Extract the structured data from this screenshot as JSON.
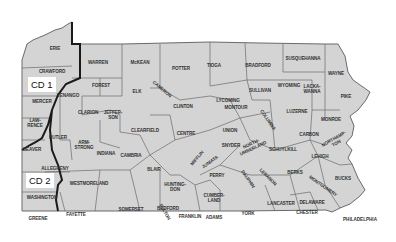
{
  "map": {
    "title": "Pennsylvania counties with congressional districts CD 1 and CD 2",
    "colors": {
      "land": "#d4d4d4",
      "county_border": "#6a6a6a",
      "district_line": "#1a1a1a",
      "background": "#ffffff",
      "label": "#333333"
    },
    "districts": [
      {
        "id": "cd1",
        "label": "CD 1"
      },
      {
        "id": "cd2",
        "label": "CD 2"
      }
    ],
    "cities": [
      {
        "id": "philadelphia",
        "label": "PHILADELPHIA"
      }
    ],
    "counties": [
      {
        "id": "erie",
        "label": "ERIE"
      },
      {
        "id": "crawford",
        "label": "CRAWFORD"
      },
      {
        "id": "mercer",
        "label": "MERCER"
      },
      {
        "id": "lawrence",
        "label": "LAW-\nRENCE"
      },
      {
        "id": "beaver",
        "label": "BEAVER"
      },
      {
        "id": "butler",
        "label": "BUTLER"
      },
      {
        "id": "allegheny",
        "label": "ALLEGHENY"
      },
      {
        "id": "washington",
        "label": "WASHINGTON"
      },
      {
        "id": "greene",
        "label": "GREENE"
      },
      {
        "id": "fayette",
        "label": "FAYETTE"
      },
      {
        "id": "westmoreland",
        "label": "WESTMORELAND"
      },
      {
        "id": "armstrong",
        "label": "ARM-\nSTRONG"
      },
      {
        "id": "indiana",
        "label": "INDIANA"
      },
      {
        "id": "venango",
        "label": "VENANGO"
      },
      {
        "id": "warren",
        "label": "WARREN"
      },
      {
        "id": "forest",
        "label": "FOREST"
      },
      {
        "id": "clarion",
        "label": "CLARION"
      },
      {
        "id": "jefferson",
        "label": "JEFFER-\nSON"
      },
      {
        "id": "mckean",
        "label": "McKEAN"
      },
      {
        "id": "elk",
        "label": "ELK"
      },
      {
        "id": "cameron",
        "label": "CAMERON"
      },
      {
        "id": "clearfield",
        "label": "CLEARFIELD"
      },
      {
        "id": "cambria",
        "label": "CAMBRIA"
      },
      {
        "id": "somerset",
        "label": "SOMERSET"
      },
      {
        "id": "bedford",
        "label": "BEDFORD"
      },
      {
        "id": "blair",
        "label": "BLAIR"
      },
      {
        "id": "huntingdon",
        "label": "HUNTING-\nDON"
      },
      {
        "id": "fulton",
        "label": "FULTON"
      },
      {
        "id": "franklin",
        "label": "FRANKLIN"
      },
      {
        "id": "potter",
        "label": "POTTER"
      },
      {
        "id": "tioga",
        "label": "TIOGA"
      },
      {
        "id": "clinton",
        "label": "CLINTON"
      },
      {
        "id": "centre",
        "label": "CENTRE"
      },
      {
        "id": "mifflin",
        "label": "MIFFLIN"
      },
      {
        "id": "juniata",
        "label": "JUNIATA"
      },
      {
        "id": "perry",
        "label": "PERRY"
      },
      {
        "id": "cumberland",
        "label": "CUMBER-\nLAND"
      },
      {
        "id": "adams",
        "label": "ADAMS"
      },
      {
        "id": "york",
        "label": "YORK"
      },
      {
        "id": "lycoming",
        "label": "LYCOMING"
      },
      {
        "id": "montour",
        "label": "MONTOUR"
      },
      {
        "id": "union",
        "label": "UNION"
      },
      {
        "id": "snyder",
        "label": "SNYDER"
      },
      {
        "id": "northumberland",
        "label": "NORTH-\nUMBERLAND"
      },
      {
        "id": "columbia",
        "label": "COLUMBIA"
      },
      {
        "id": "dauphin",
        "label": "DAUPHIN"
      },
      {
        "id": "lebanon",
        "label": "LEBANON"
      },
      {
        "id": "lancaster",
        "label": "LANCASTER"
      },
      {
        "id": "schuylkill",
        "label": "SCHUYLKILL"
      },
      {
        "id": "berks",
        "label": "BERKS"
      },
      {
        "id": "chester",
        "label": "CHESTER"
      },
      {
        "id": "delaware",
        "label": "DELAWARE"
      },
      {
        "id": "montgomery",
        "label": "MONTGOMERY"
      },
      {
        "id": "bucks",
        "label": "BUCKS"
      },
      {
        "id": "lehigh",
        "label": "LEHIGH"
      },
      {
        "id": "northampton",
        "label": "NORTHAMP-\nTON"
      },
      {
        "id": "carbon",
        "label": "CARBON"
      },
      {
        "id": "monroe",
        "label": "MONROE"
      },
      {
        "id": "luzerne",
        "label": "LUZERNE"
      },
      {
        "id": "pike",
        "label": "PIKE"
      },
      {
        "id": "wayne",
        "label": "WAYNE"
      },
      {
        "id": "lackawanna",
        "label": "LACKA-\nWANNA"
      },
      {
        "id": "wyoming",
        "label": "WYOMING"
      },
      {
        "id": "susquehanna",
        "label": "SUSQUEHANNA"
      },
      {
        "id": "bradford",
        "label": "BRADFORD"
      },
      {
        "id": "sullivan",
        "label": "SULLIVAN"
      }
    ]
  }
}
